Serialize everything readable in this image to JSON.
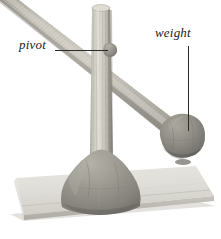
{
  "figure": {
    "kind": "photograph-with-callouts",
    "width": 221,
    "height": 239,
    "background_color": "#ffffff"
  },
  "labels": [
    {
      "id": "pivot",
      "text": "pivot",
      "style": "italic-serif",
      "color": "#1b1b1b",
      "leader": "horizontal-line-right"
    },
    {
      "id": "weight",
      "text": "weight",
      "style": "italic-serif",
      "color": "#1b1b1b",
      "leader": "vertical-line-down"
    }
  ],
  "scene": {
    "parts": [
      {
        "name": "vertical-post",
        "material": "wooden dowel",
        "color": "#c9c6bd"
      },
      {
        "name": "diagonal-arm",
        "material": "wooden dowel",
        "color": "#b4b1a8"
      },
      {
        "name": "pivot-blob",
        "material": "modelling clay",
        "color": "#8f8d88"
      },
      {
        "name": "weight-ball",
        "material": "modelling clay",
        "color": "#8a8984"
      },
      {
        "name": "clay-base",
        "material": "modelling clay",
        "color": "#949289"
      },
      {
        "name": "board",
        "material": "painted board",
        "color": "#dedcd6"
      }
    ]
  },
  "colors": {
    "background": "#ffffff",
    "label_text": "#1b1b1b",
    "leader_line": "#2a2a2a",
    "dowel_light": "#d2cfc6",
    "dowel_mid": "#bcb9b0",
    "dowel_shadow": "#8f8d85",
    "clay_light": "#a9a79e",
    "clay_mid": "#908e86",
    "clay_dark": "#6e6c66",
    "board_light": "#e4e2dc",
    "board_mid": "#d3d1ca",
    "board_edge": "#b6b4ad"
  }
}
